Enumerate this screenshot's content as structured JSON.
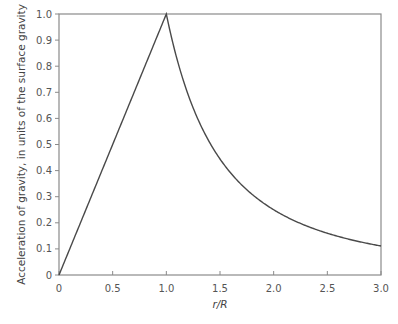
{
  "chart_data": {
    "type": "line",
    "title": "",
    "xlabel": "r/R",
    "ylabel": "Acceleration of gravity, in units of the surface gravity",
    "xlim": [
      0,
      3.0
    ],
    "ylim": [
      0,
      1.0
    ],
    "x_ticks": [
      "0",
      "0.5",
      "1.0",
      "1.5",
      "2.0",
      "2.5",
      "3.0"
    ],
    "y_ticks": [
      "0",
      "0.1",
      "0.2",
      "0.3",
      "0.4",
      "0.5",
      "0.6",
      "0.7",
      "0.8",
      "0.9",
      "1.0"
    ],
    "grid": false,
    "legend": null,
    "series": [
      {
        "name": "g(r)/g_surface",
        "description": "Linear inside (g = r/R for r<=R), inverse-square outside (g = (R/r)^2 for r>=R)",
        "x": [
          0,
          0.25,
          0.5,
          0.75,
          1.0,
          1.25,
          1.5,
          1.75,
          2.0,
          2.25,
          2.5,
          2.75,
          3.0
        ],
        "values": [
          0,
          0.25,
          0.5,
          0.75,
          1.0,
          0.64,
          0.444,
          0.327,
          0.25,
          0.198,
          0.16,
          0.132,
          0.111
        ]
      }
    ],
    "colors": {
      "line": "#4a4a4a",
      "axes": "#8a8a8a",
      "text": "#555555"
    }
  }
}
